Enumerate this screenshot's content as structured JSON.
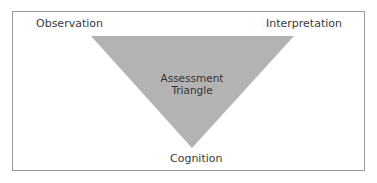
{
  "diagram": {
    "title": "Assessment Triangle",
    "center_label_line1": "Assessment",
    "center_label_line2": "Triangle",
    "vertices": {
      "top_left": "Observation",
      "top_right": "Interpretation",
      "bottom": "Cognition"
    },
    "colors": {
      "triangle_fill": "#b3b3b3",
      "border": "#9a9a9a",
      "text": "#3a3a3a"
    }
  }
}
